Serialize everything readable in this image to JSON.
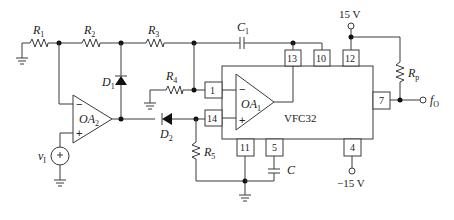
{
  "diagram": {
    "type": "circuit-schematic",
    "ic": {
      "name": "VFC32",
      "internal_opamp": "OA",
      "internal_opamp_sub": "1"
    },
    "external_opamp": {
      "name": "OA",
      "sub": "2"
    },
    "resistors": [
      {
        "id": "R1",
        "name": "R",
        "sub": "1"
      },
      {
        "id": "R2",
        "name": "R",
        "sub": "2"
      },
      {
        "id": "R3",
        "name": "R",
        "sub": "3"
      },
      {
        "id": "R4",
        "name": "R",
        "sub": "4"
      },
      {
        "id": "R5",
        "name": "R",
        "sub": "5"
      },
      {
        "id": "Rp",
        "name": "R",
        "sub": "p"
      }
    ],
    "capacitors": [
      {
        "id": "C1",
        "name": "C",
        "sub": "1"
      },
      {
        "id": "C",
        "name": "C",
        "sub": ""
      }
    ],
    "diodes": [
      {
        "id": "D1",
        "name": "D",
        "sub": "1"
      },
      {
        "id": "D2",
        "name": "D",
        "sub": "2"
      }
    ],
    "pins": {
      "p1": "1",
      "p14": "14",
      "p13": "13",
      "p10": "10",
      "p12": "12",
      "p7": "7",
      "p11": "11",
      "p5": "5",
      "p4": "4"
    },
    "supplies": {
      "positive": "15 V",
      "negative": "−15 V"
    },
    "source": {
      "name": "v",
      "sub": "I"
    },
    "output": {
      "name": "f",
      "sub": "O"
    },
    "signs": {
      "minus": "−",
      "plus": "+"
    }
  }
}
